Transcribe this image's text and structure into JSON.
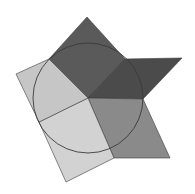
{
  "figure": {
    "width": 195,
    "height": 194,
    "background": "#ffffff",
    "center": [
      88,
      98
    ],
    "circle": {
      "cx": 88,
      "cy": 98,
      "r": 55,
      "stroke": "#3a3a3a",
      "stroke_width": 0.9
    },
    "edge_color": "#3a3a3a",
    "regions": [
      {
        "name": "top-dark-kite",
        "fill": "#5a5a5a",
        "points": [
          [
            88,
            98
          ],
          [
            49,
            59
          ],
          [
            87,
            17
          ],
          [
            125,
            59
          ]
        ]
      },
      {
        "name": "right-dark-parallelogram",
        "fill": "#4b4b4b",
        "points": [
          [
            88,
            98
          ],
          [
            125,
            59
          ],
          [
            182,
            58
          ],
          [
            143,
            99
          ]
        ]
      },
      {
        "name": "lower-right-medium-parallelogram",
        "fill": "#8a8a8a",
        "points": [
          [
            88,
            98
          ],
          [
            143,
            99
          ],
          [
            170,
            158
          ],
          [
            114,
            158
          ]
        ]
      },
      {
        "name": "bottom-light-rectangle",
        "fill": "#d2d2d2",
        "points": [
          [
            88,
            98
          ],
          [
            114,
            158
          ],
          [
            66,
            182
          ],
          [
            39,
            122
          ]
        ]
      },
      {
        "name": "left-light-quad",
        "fill": "#c6c6c6",
        "points": [
          [
            88,
            98
          ],
          [
            39,
            122
          ],
          [
            16,
            74
          ],
          [
            49,
            59
          ]
        ]
      }
    ]
  }
}
